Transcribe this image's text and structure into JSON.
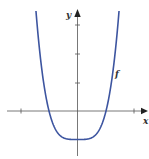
{
  "chart_data": {
    "type": "line",
    "title": "",
    "xlabel": "x",
    "ylabel": "y",
    "series": [
      {
        "name": "f",
        "expression": "x^4 - 1",
        "x": [
          -1.44,
          -1.25,
          -1.0,
          -0.75,
          -0.5,
          -0.25,
          0,
          0.25,
          0.5,
          0.75,
          1.0,
          1.25,
          1.44
        ],
        "values": [
          3.3,
          1.44,
          0,
          -0.68,
          -0.94,
          -1.0,
          -1.0,
          -1.0,
          -0.94,
          -0.68,
          0,
          1.44,
          3.3
        ]
      }
    ],
    "x_ticks": [
      -2,
      2
    ],
    "y_ticks": [
      1,
      2,
      3
    ],
    "xlim": [
      -2.7,
      2.5
    ],
    "ylim": [
      -1.6,
      3.5
    ],
    "grid": false,
    "legend": "none",
    "annotations": [
      {
        "text": "f",
        "near": "right branch"
      }
    ]
  },
  "labels": {
    "x_axis": "x",
    "y_axis": "y",
    "curve": "f"
  },
  "colors": {
    "curve": "#3d55a0",
    "axis": "#555555"
  },
  "layout": {
    "origin_px": [
      77.5,
      111
    ],
    "unit_px": 28.5,
    "clip_top_px": 11
  }
}
